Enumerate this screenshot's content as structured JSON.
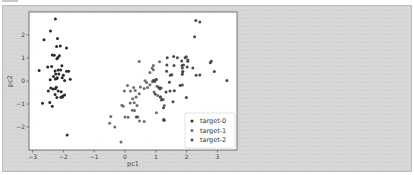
{
  "chart_data": {
    "type": "scatter",
    "title": "",
    "xlabel": "pc1",
    "ylabel": "pc2",
    "xlim": [
      -3.25,
      3.55
    ],
    "ylim": [
      -2.9,
      3.0
    ],
    "xticks": [
      -3,
      -2,
      -1,
      0,
      1,
      2,
      3
    ],
    "yticks": [
      -2,
      -1,
      0,
      1,
      2
    ],
    "grid": false,
    "legend_position": "lower right",
    "series": [
      {
        "name": "target-0",
        "color": "#2b2b2b",
        "points": [
          [
            -2.26,
            2.69
          ],
          [
            -2.42,
            2.17
          ],
          [
            -2.63,
            1.79
          ],
          [
            -2.19,
            1.85
          ],
          [
            -1.9,
            1.44
          ],
          [
            -2.22,
            1.5
          ],
          [
            -2.1,
            1.52
          ],
          [
            -2.3,
            1.12
          ],
          [
            -2.36,
            1.13
          ],
          [
            -2.18,
            1.02
          ],
          [
            -2.21,
            0.97
          ],
          [
            -2.13,
            1.1
          ],
          [
            -2.79,
            0.46
          ],
          [
            -2.51,
            0.61
          ],
          [
            -2.38,
            0.63
          ],
          [
            -2.17,
            0.48
          ],
          [
            -2.27,
            0.43
          ],
          [
            -2.05,
            0.66
          ],
          [
            -1.9,
            0.42
          ],
          [
            -1.83,
            0.42
          ],
          [
            -2.0,
            0.25
          ],
          [
            -2.25,
            0.3
          ],
          [
            -2.09,
            0.48
          ],
          [
            -2.15,
            0.3
          ],
          [
            -2.32,
            0.19
          ],
          [
            -2.43,
            0.05
          ],
          [
            -2.21,
            0.11
          ],
          [
            -2.2,
            0.14
          ],
          [
            -2.04,
            0.14
          ],
          [
            -1.96,
            0.02
          ],
          [
            -2.26,
            0.09
          ],
          [
            -1.78,
            0.08
          ],
          [
            -2.49,
            -0.44
          ],
          [
            -2.34,
            -0.35
          ],
          [
            -2.26,
            -0.34
          ],
          [
            -2.17,
            -0.44
          ],
          [
            -2.07,
            -0.47
          ],
          [
            -2.23,
            -0.27
          ],
          [
            -2.41,
            -0.31
          ],
          [
            -2.27,
            -0.59
          ],
          [
            -2.02,
            -0.65
          ],
          [
            -1.96,
            -0.61
          ],
          [
            -2.21,
            -0.72
          ],
          [
            -2.08,
            -0.71
          ],
          [
            -2.68,
            -0.97
          ],
          [
            -2.44,
            -0.94
          ],
          [
            -2.36,
            -1.1
          ],
          [
            -2.03,
            -0.7
          ],
          [
            -1.88,
            -2.35
          ]
        ]
      },
      {
        "name": "target-1",
        "color": "#6e6e6e",
        "points": [
          [
            -0.13,
            -2.65
          ],
          [
            -0.5,
            -1.84
          ],
          [
            -0.46,
            -1.54
          ],
          [
            -0.33,
            -2.0
          ],
          [
            -0.1,
            -1.05
          ],
          [
            -0.06,
            -1.1
          ],
          [
            0.0,
            -1.57
          ],
          [
            0.1,
            -1.58
          ],
          [
            0.17,
            -0.96
          ],
          [
            0.25,
            -0.77
          ],
          [
            0.3,
            -0.95
          ],
          [
            0.31,
            -1.28
          ],
          [
            0.24,
            -1.27
          ],
          [
            0.39,
            -1.07
          ],
          [
            0.42,
            -1.57
          ],
          [
            0.47,
            -1.74
          ],
          [
            0.62,
            -1.76
          ],
          [
            0.36,
            -0.7
          ],
          [
            0.33,
            -0.41
          ],
          [
            0.08,
            -0.2
          ],
          [
            0.28,
            -0.28
          ],
          [
            0.46,
            -0.55
          ],
          [
            0.5,
            -0.26
          ],
          [
            0.62,
            -0.33
          ],
          [
            0.7,
            -0.06
          ],
          [
            0.65,
            0.01
          ],
          [
            0.73,
            -0.28
          ],
          [
            0.89,
            -0.03
          ],
          [
            0.96,
            0.02
          ],
          [
            1.0,
            0.05
          ],
          [
            0.81,
            -0.16
          ],
          [
            0.46,
            0.85
          ],
          [
            0.92,
            0.49
          ],
          [
            0.81,
            0.37
          ],
          [
            0.88,
            0.56
          ],
          [
            0.92,
            0.68
          ],
          [
            1.12,
            0.84
          ],
          [
            1.04,
            -0.23
          ],
          [
            1.06,
            -0.63
          ],
          [
            1.18,
            -0.82
          ],
          [
            1.28,
            -1.07
          ],
          [
            1.24,
            -0.81
          ],
          [
            1.02,
            -1.38
          ],
          [
            1.26,
            -1.66
          ],
          [
            1.28,
            -1.71
          ],
          [
            1.07,
            -0.26
          ],
          [
            1.13,
            -0.35
          ],
          [
            0.94,
            -0.48
          ],
          [
            -0.02,
            -0.44
          ],
          [
            0.18,
            -0.43
          ]
        ]
      },
      {
        "name": "target-2",
        "color": "#4a4a4a",
        "points": [
          [
            1.84,
            0.87
          ],
          [
            1.15,
            -0.7
          ],
          [
            2.2,
            0.56
          ],
          [
            1.44,
            -0.05
          ],
          [
            1.86,
            0.29
          ],
          [
            2.77,
            0.79
          ],
          [
            0.37,
            -1.56
          ],
          [
            2.31,
            0.25
          ],
          [
            1.99,
            -0.72
          ],
          [
            2.26,
            1.92
          ],
          [
            1.36,
            0.69
          ],
          [
            1.6,
            -0.42
          ],
          [
            1.88,
            0.41
          ],
          [
            1.25,
            -1.16
          ],
          [
            1.46,
            -0.44
          ],
          [
            1.59,
            0.68
          ],
          [
            1.47,
            0.25
          ],
          [
            2.43,
            2.56
          ],
          [
            3.31,
            0.02
          ],
          [
            1.26,
            -1.71
          ],
          [
            2.04,
            0.91
          ],
          [
            0.98,
            -0.57
          ],
          [
            2.9,
            0.41
          ],
          [
            1.33,
            -0.48
          ],
          [
            1.7,
            1.01
          ],
          [
            1.95,
            1.01
          ],
          [
            1.17,
            -0.31
          ],
          [
            1.02,
            0.06
          ],
          [
            1.79,
            -0.19
          ],
          [
            1.86,
            0.56
          ],
          [
            2.43,
            0.26
          ],
          [
            2.3,
            2.63
          ],
          [
            1.86,
            -0.18
          ],
          [
            1.11,
            -0.29
          ],
          [
            1.2,
            -0.81
          ],
          [
            2.8,
            0.86
          ],
          [
            1.58,
            1.07
          ],
          [
            1.35,
            0.42
          ],
          [
            0.92,
            0.02
          ],
          [
            1.85,
            0.67
          ],
          [
            2.02,
            0.61
          ],
          [
            1.9,
            0.69
          ],
          [
            1.15,
            -0.7
          ],
          [
            2.04,
            0.86
          ],
          [
            1.99,
            1.05
          ],
          [
            1.87,
            0.39
          ],
          [
            1.56,
            -0.9
          ],
          [
            1.52,
            0.27
          ],
          [
            1.37,
            1.01
          ],
          [
            0.96,
            -0.02
          ]
        ]
      }
    ]
  },
  "page": {
    "legend": {
      "items": [
        {
          "label": "target-0",
          "color": "#2b2b2b"
        },
        {
          "label": "target-1",
          "color": "#6e6e6e"
        },
        {
          "label": "target-2",
          "color": "#4a4a4a"
        }
      ]
    }
  }
}
